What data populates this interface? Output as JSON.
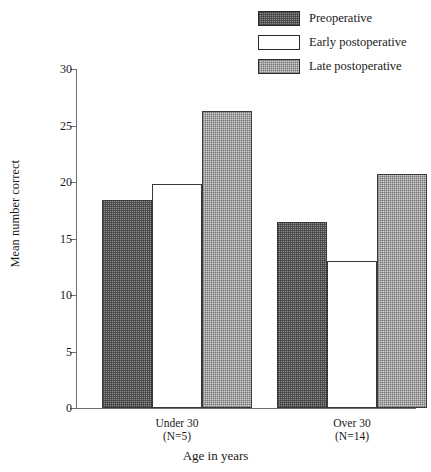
{
  "chart_data": {
    "type": "bar",
    "title": "",
    "xlabel": "Age in years",
    "ylabel": "Mean number correct",
    "categories": [
      "Under 30",
      "Over 30"
    ],
    "category_sublabels": [
      "(N=5)",
      "(N=14)"
    ],
    "series": [
      {
        "name": "Preoperative",
        "values": [
          18.4,
          16.5
        ],
        "swatch": "dark"
      },
      {
        "name": "Early postoperative",
        "values": [
          19.8,
          13.0
        ],
        "swatch": "white"
      },
      {
        "name": "Late postoperative",
        "values": [
          26.3,
          20.7
        ],
        "swatch": "light"
      }
    ],
    "ylim": [
      0,
      30
    ],
    "yticks": [
      0,
      5,
      10,
      15,
      20,
      25,
      30
    ],
    "ytick_labels": [
      "0",
      "5",
      "10",
      "15",
      "20",
      "25",
      "30"
    ],
    "grid": false,
    "legend_position": "top-right",
    "colors": {
      "dark": "#8e8e8e",
      "white": "#ffffff",
      "light": "#d2d2d2",
      "axis": "#6f6f6f",
      "bar_border": "#3a3a3a",
      "text": "#1a1a1a",
      "background": "#ffffff"
    }
  },
  "legend": {
    "items": [
      {
        "label": "Preoperative"
      },
      {
        "label": "Early postoperative"
      },
      {
        "label": "Late postoperative"
      }
    ]
  },
  "axes": {
    "y_title": "Mean number correct",
    "x_title": "Age in years"
  },
  "groups": [
    {
      "name": "Under 30",
      "n": "(N=5)"
    },
    {
      "name": "Over 30",
      "n": "(N=14)"
    }
  ]
}
